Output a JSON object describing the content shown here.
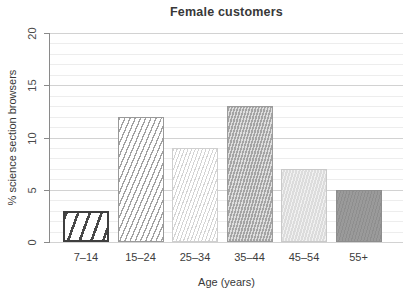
{
  "chart_data": {
    "type": "bar",
    "title": "Female customers",
    "xlabel": "Age (years)",
    "ylabel": "% science section browsers",
    "categories": [
      "7–14",
      "15–24",
      "25–34",
      "35–44",
      "45–54",
      "55+"
    ],
    "values": [
      3,
      12,
      9,
      13,
      7,
      5
    ],
    "ylim": [
      0,
      20
    ],
    "yticks": [
      0,
      5,
      10,
      15,
      20
    ],
    "minor_grid_step": 1,
    "grid": "horizontal, minor every 1, major every 5",
    "legend": "none",
    "bar_patterns": [
      {
        "category": "7–14",
        "pattern": "wide-dark-diagonal-hatch",
        "stroke": "#3f3f3f",
        "fill": "#ffffff"
      },
      {
        "category": "15–24",
        "pattern": "medium-diagonal-hatch",
        "stroke": "#9a9a9a",
        "fill": "#ffffff"
      },
      {
        "category": "25–34",
        "pattern": "fine-light-diagonal-hatch",
        "stroke": "#d4d4d4",
        "fill": "#ffffff"
      },
      {
        "category": "35–44",
        "pattern": "dense-diagonal-hatch",
        "stroke": "#a4a4a4",
        "fill": "#dedede"
      },
      {
        "category": "45–54",
        "pattern": "fine-texture-solid",
        "stroke": "#c9c9c9",
        "fill": "#dcdcdc"
      },
      {
        "category": "55+",
        "pattern": "fine-texture-solid",
        "stroke": "#8d8d8d",
        "fill": "#9a9a9a"
      }
    ],
    "colors": {
      "grid_minor": "#ededed",
      "grid_major": "#d2d2d2",
      "axis": "#8a8a8a",
      "text": "#383838"
    }
  }
}
